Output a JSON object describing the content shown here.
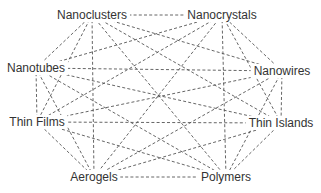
{
  "diagram": {
    "type": "complete-graph",
    "edge_style": "dashed",
    "colors": {
      "edge": "#555555",
      "text": "#333333",
      "background": "#ffffff"
    },
    "nodes": [
      {
        "id": "nanoclusters",
        "label": "Nanoclusters",
        "x": 92,
        "y": 15
      },
      {
        "id": "nanocrystals",
        "label": "Nanocrystals",
        "x": 222,
        "y": 15
      },
      {
        "id": "nanotubes",
        "label": "Nanotubes",
        "x": 36,
        "y": 68
      },
      {
        "id": "nanowires",
        "label": "Nanowires",
        "x": 282,
        "y": 71
      },
      {
        "id": "thin_films",
        "label": "Thin Films",
        "x": 37,
        "y": 122
      },
      {
        "id": "thin_islands",
        "label": "Thin Islands",
        "x": 281,
        "y": 123
      },
      {
        "id": "aerogels",
        "label": "Aerogels",
        "x": 94,
        "y": 177
      },
      {
        "id": "polymers",
        "label": "Polymers",
        "x": 226,
        "y": 177
      }
    ],
    "edges": [
      [
        "nanoclusters",
        "nanocrystals"
      ],
      [
        "nanoclusters",
        "nanotubes"
      ],
      [
        "nanoclusters",
        "nanowires"
      ],
      [
        "nanoclusters",
        "thin_films"
      ],
      [
        "nanoclusters",
        "thin_islands"
      ],
      [
        "nanoclusters",
        "aerogels"
      ],
      [
        "nanoclusters",
        "polymers"
      ],
      [
        "nanocrystals",
        "nanotubes"
      ],
      [
        "nanocrystals",
        "nanowires"
      ],
      [
        "nanocrystals",
        "thin_films"
      ],
      [
        "nanocrystals",
        "thin_islands"
      ],
      [
        "nanocrystals",
        "aerogels"
      ],
      [
        "nanocrystals",
        "polymers"
      ],
      [
        "nanotubes",
        "nanowires"
      ],
      [
        "nanotubes",
        "thin_films"
      ],
      [
        "nanotubes",
        "thin_islands"
      ],
      [
        "nanotubes",
        "aerogels"
      ],
      [
        "nanotubes",
        "polymers"
      ],
      [
        "nanowires",
        "thin_films"
      ],
      [
        "nanowires",
        "thin_islands"
      ],
      [
        "nanowires",
        "aerogels"
      ],
      [
        "nanowires",
        "polymers"
      ],
      [
        "thin_films",
        "thin_islands"
      ],
      [
        "thin_films",
        "aerogels"
      ],
      [
        "thin_films",
        "polymers"
      ],
      [
        "thin_islands",
        "aerogels"
      ],
      [
        "thin_islands",
        "polymers"
      ],
      [
        "aerogels",
        "polymers"
      ]
    ]
  }
}
